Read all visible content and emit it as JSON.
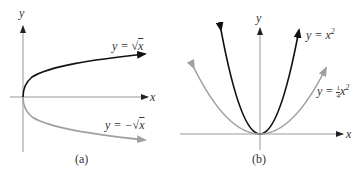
{
  "figures": {
    "a": {
      "caption": "(a)",
      "axes": {
        "x_label": "x",
        "y_label": "y"
      },
      "curves": [
        {
          "name": "sqrt-x",
          "label_prefix": "y = ",
          "label_root": "x",
          "label_sign": "",
          "color": "#111111"
        },
        {
          "name": "neg-sqrt-x",
          "label_prefix": "y = ",
          "label_root": "x",
          "label_sign": "−",
          "color": "#a0a0a0"
        }
      ]
    },
    "b": {
      "caption": "(b)",
      "axes": {
        "x_label": "x",
        "y_label": "y"
      },
      "curves": [
        {
          "name": "x-squared",
          "label_prefix": "y = ",
          "label_var": "x",
          "label_exp": "2",
          "color": "#111111"
        },
        {
          "name": "quarter-x-squared",
          "label_prefix": "y = ",
          "label_num": "1",
          "label_den": "4",
          "label_var": "x",
          "label_exp": "2",
          "color": "#a0a0a0"
        }
      ]
    }
  }
}
